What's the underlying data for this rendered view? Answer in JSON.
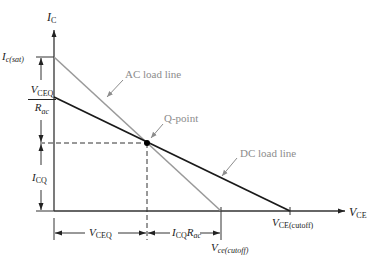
{
  "diagram": {
    "type": "transistor load line diagram",
    "axes": {
      "y_axis": {
        "symbol": "I",
        "subscript": "C"
      },
      "x_axis": {
        "symbol": "V",
        "subscript": "CE"
      }
    },
    "labels": {
      "ic_sat": {
        "symbol": "I",
        "subscript": "c(sat)"
      },
      "vceq_over_rac": {
        "numerator_symbol": "V",
        "numerator_subscript": "CEQ",
        "denominator_symbol": "R",
        "denominator_subscript": "ac"
      },
      "icq": {
        "symbol": "I",
        "subscript": "CQ"
      },
      "vceq": {
        "symbol": "V",
        "subscript": "CEQ"
      },
      "icq_rac": {
        "symbol1": "I",
        "subscript1": "CQ",
        "symbol2": "R",
        "subscript2": "ac"
      },
      "vce_cutoff_ac": {
        "symbol": "V",
        "subscript": "ce(cutoff)"
      },
      "vce_cutoff_dc": {
        "symbol": "V",
        "subscript": "CE(cutoff)"
      }
    },
    "annotations": {
      "ac_load_line": "AC load line",
      "dc_load_line": "DC load line",
      "q_point": "Q-point"
    },
    "colors": {
      "axis": "#333333",
      "dc_line": "#1a1a1a",
      "ac_line": "#9a9a9a",
      "annotation_text": "#8c8c8c",
      "q_point": "#000000"
    }
  }
}
